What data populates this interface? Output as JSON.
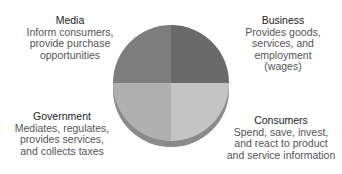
{
  "diagram": {
    "type": "quadrant-pie",
    "sectors": [
      {
        "id": "media",
        "title": "Media",
        "lines": [
          "Inform consumers,",
          "provide purchase",
          "opportunities"
        ],
        "color": "#7e7e7e"
      },
      {
        "id": "business",
        "title": "Business",
        "lines": [
          "Provides goods,",
          "services, and",
          "employment",
          "(wages)"
        ],
        "color": "#6a6a6a"
      },
      {
        "id": "government",
        "title": "Government",
        "lines": [
          "Mediates, regulates,",
          "provides services,",
          "and collects taxes"
        ],
        "color": "#b0b0b0"
      },
      {
        "id": "consumers",
        "title": "Consumers",
        "lines": [
          "Spend, save, invest,",
          "and react to product",
          "and service information"
        ],
        "color": "#c4c4c4"
      }
    ],
    "edge_color": "#8a8a8a"
  }
}
